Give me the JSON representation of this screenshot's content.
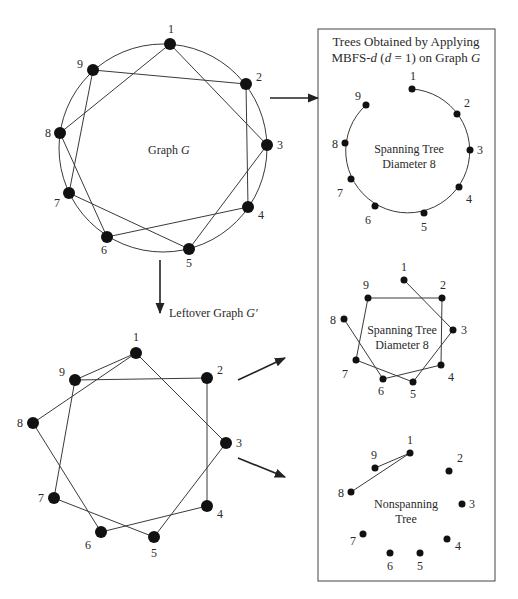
{
  "colors": {
    "ink": "#111111",
    "line": "#3a3a3a",
    "background": "#ffffff"
  },
  "graph_g": {
    "title": "Graph",
    "title_var": "G",
    "circle": {
      "cx": 163,
      "cy": 148,
      "r": 104
    },
    "node_radius": 6,
    "nodes": [
      {
        "id": "1",
        "x": 170,
        "y": 44,
        "lx": 168,
        "ly": 33
      },
      {
        "id": "2",
        "x": 246,
        "y": 84,
        "lx": 256,
        "ly": 81
      },
      {
        "id": "3",
        "x": 267,
        "y": 145,
        "lx": 277,
        "ly": 149
      },
      {
        "id": "4",
        "x": 248,
        "y": 207,
        "lx": 258,
        "ly": 219
      },
      {
        "id": "5",
        "x": 189,
        "y": 249,
        "lx": 186,
        "ly": 267
      },
      {
        "id": "6",
        "x": 107,
        "y": 237,
        "lx": 101,
        "ly": 254
      },
      {
        "id": "7",
        "x": 69,
        "y": 193,
        "lx": 54,
        "ly": 207
      },
      {
        "id": "8",
        "x": 60,
        "y": 133,
        "lx": 45,
        "ly": 137
      },
      {
        "id": "9",
        "x": 93,
        "y": 70,
        "lx": 77,
        "ly": 68
      }
    ],
    "edges": [
      [
        "1",
        "3"
      ],
      [
        "1",
        "8"
      ],
      [
        "9",
        "2"
      ],
      [
        "9",
        "7"
      ],
      [
        "2",
        "4"
      ],
      [
        "3",
        "5"
      ],
      [
        "8",
        "6"
      ],
      [
        "7",
        "5"
      ],
      [
        "6",
        "4"
      ]
    ]
  },
  "leftover": {
    "label": "Leftover Graph",
    "label_var": "G′",
    "node_radius": 6,
    "nodes": [
      {
        "id": "1",
        "x": 136,
        "y": 353,
        "lx": 133,
        "ly": 341
      },
      {
        "id": "2",
        "x": 207,
        "y": 378,
        "lx": 217,
        "ly": 374
      },
      {
        "id": "3",
        "x": 226,
        "y": 443,
        "lx": 236,
        "ly": 447
      },
      {
        "id": "4",
        "x": 207,
        "y": 506,
        "lx": 217,
        "ly": 518
      },
      {
        "id": "5",
        "x": 154,
        "y": 537,
        "lx": 151,
        "ly": 557
      },
      {
        "id": "6",
        "x": 101,
        "y": 532,
        "lx": 85,
        "ly": 549
      },
      {
        "id": "7",
        "x": 54,
        "y": 498,
        "lx": 38,
        "ly": 502
      },
      {
        "id": "8",
        "x": 33,
        "y": 423,
        "lx": 17,
        "ly": 427
      },
      {
        "id": "9",
        "x": 75,
        "y": 380,
        "lx": 59,
        "ly": 376
      }
    ],
    "edges": [
      [
        "1",
        "9"
      ],
      [
        "1",
        "8"
      ],
      [
        "1",
        "3"
      ],
      [
        "9",
        "2"
      ],
      [
        "9",
        "7"
      ],
      [
        "2",
        "4"
      ],
      [
        "3",
        "5"
      ],
      [
        "8",
        "6"
      ],
      [
        "7",
        "5"
      ],
      [
        "6",
        "4"
      ]
    ]
  },
  "trees_box": {
    "title_line1": "Trees Obtained  by Applying",
    "title_line2_prefix": "MBFS-",
    "title_line2_d": "d",
    "title_line2_mid": " (",
    "title_line2_d2": "d",
    "title_line2_eq": " = 1) on Graph ",
    "title_line2_g": "G",
    "tree1": {
      "label_line1": "Spanning Tree",
      "label_line2": "Diameter 8",
      "arc": {
        "cx": 408,
        "cy": 150,
        "r": 62
      },
      "node_radius": 3.5,
      "nodes": [
        {
          "id": "1",
          "x": 412,
          "y": 89,
          "lx": 410,
          "ly": 80
        },
        {
          "id": "2",
          "x": 457,
          "y": 114,
          "lx": 464,
          "ly": 107
        },
        {
          "id": "3",
          "x": 470,
          "y": 150,
          "lx": 477,
          "ly": 154
        },
        {
          "id": "4",
          "x": 459,
          "y": 187,
          "lx": 466,
          "ly": 203
        },
        {
          "id": "5",
          "x": 424,
          "y": 213,
          "lx": 421,
          "ly": 231
        },
        {
          "id": "6",
          "x": 375,
          "y": 206,
          "lx": 365,
          "ly": 224
        },
        {
          "id": "7",
          "x": 351,
          "y": 179,
          "lx": 337,
          "ly": 197
        },
        {
          "id": "8",
          "x": 345,
          "y": 143,
          "lx": 332,
          "ly": 148
        },
        {
          "id": "9",
          "x": 366,
          "y": 105,
          "lx": 355,
          "ly": 100
        }
      ]
    },
    "tree2": {
      "label_line1": "Spanning Tree",
      "label_line2": "Diameter 8",
      "node_radius": 3.5,
      "nodes": [
        {
          "id": "1",
          "x": 404,
          "y": 280,
          "lx": 401,
          "ly": 271
        },
        {
          "id": "2",
          "x": 442,
          "y": 298,
          "lx": 440,
          "ly": 289
        },
        {
          "id": "3",
          "x": 453,
          "y": 330,
          "lx": 461,
          "ly": 334
        },
        {
          "id": "4",
          "x": 441,
          "y": 365,
          "lx": 448,
          "ly": 381
        },
        {
          "id": "5",
          "x": 413,
          "y": 382,
          "lx": 410,
          "ly": 398
        },
        {
          "id": "6",
          "x": 383,
          "y": 379,
          "lx": 378,
          "ly": 395
        },
        {
          "id": "7",
          "x": 356,
          "y": 360,
          "lx": 342,
          "ly": 378
        },
        {
          "id": "8",
          "x": 344,
          "y": 319,
          "lx": 330,
          "ly": 324
        },
        {
          "id": "9",
          "x": 368,
          "y": 298,
          "lx": 363,
          "ly": 289
        }
      ],
      "edges": [
        [
          "1",
          "3"
        ],
        [
          "3",
          "5"
        ],
        [
          "5",
          "7"
        ],
        [
          "7",
          "9"
        ],
        [
          "9",
          "2"
        ],
        [
          "2",
          "4"
        ],
        [
          "4",
          "6"
        ],
        [
          "6",
          "8"
        ]
      ]
    },
    "tree3": {
      "label_line1": "Nonspanning",
      "label_line2": "Tree",
      "node_radius": 3.5,
      "nodes": [
        {
          "id": "1",
          "x": 410,
          "y": 453,
          "lx": 407,
          "ly": 444
        },
        {
          "id": "2",
          "x": 449,
          "y": 471,
          "lx": 457,
          "ly": 462
        },
        {
          "id": "3",
          "x": 462,
          "y": 504,
          "lx": 469,
          "ly": 508
        },
        {
          "id": "4",
          "x": 447,
          "y": 539,
          "lx": 455,
          "ly": 550
        },
        {
          "id": "5",
          "x": 420,
          "y": 553,
          "lx": 417,
          "ly": 570
        },
        {
          "id": "6",
          "x": 390,
          "y": 553,
          "lx": 387,
          "ly": 570
        },
        {
          "id": "7",
          "x": 363,
          "y": 534,
          "lx": 350,
          "ly": 545
        },
        {
          "id": "8",
          "x": 351,
          "y": 492,
          "lx": 338,
          "ly": 497
        },
        {
          "id": "9",
          "x": 375,
          "y": 468,
          "lx": 371,
          "ly": 459
        }
      ],
      "edges": [
        [
          "1",
          "9"
        ],
        [
          "1",
          "8"
        ]
      ]
    }
  }
}
